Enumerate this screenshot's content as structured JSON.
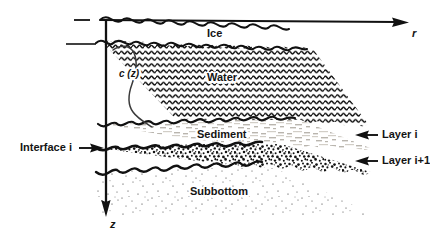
{
  "figure": {
    "media": [
      {
        "key": "ice",
        "label": "Ice"
      },
      {
        "key": "water",
        "label": "Water"
      },
      {
        "key": "sediment",
        "label": "Sediment"
      },
      {
        "key": "subbottom",
        "label": "Subbottom"
      }
    ],
    "axes": {
      "range_label": "r",
      "depth_label": "z"
    },
    "annotations": {
      "sound_speed_profile": "c (z)",
      "interface": "Interface i",
      "layer_i": "Layer i",
      "layer_i_plus_1": "Layer i+1"
    },
    "colors": {
      "ink": "#141414",
      "paper": "#ffffff",
      "sediment_fill": "#e8e6e2"
    }
  }
}
